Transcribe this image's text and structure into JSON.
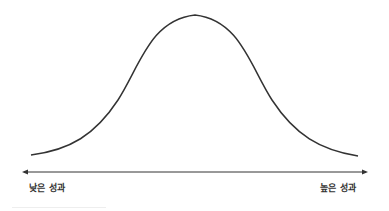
{
  "diagram": {
    "type": "bell-curve",
    "axis": {
      "left_label": "낮은 성과",
      "right_label": "높은 성과",
      "direction": "bidirectional"
    },
    "colors": {
      "curve": "#333333",
      "axis": "#333333",
      "text": "#333333",
      "background": "#ffffff"
    }
  }
}
